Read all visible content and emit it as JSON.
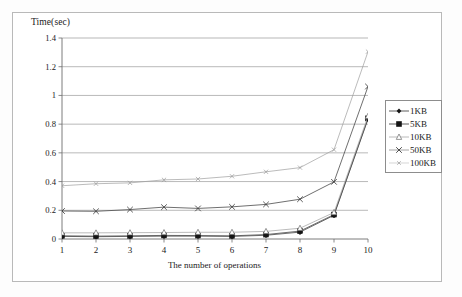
{
  "chart_data": {
    "type": "line",
    "title": "",
    "xlabel": "The number of operations",
    "ylabel": "Time(sec)",
    "x": [
      1,
      2,
      3,
      4,
      5,
      6,
      7,
      8,
      9,
      10
    ],
    "categories": [
      "1",
      "2",
      "3",
      "4",
      "5",
      "6",
      "7",
      "8",
      "9",
      "10"
    ],
    "xlim": [
      1,
      10
    ],
    "ylim": [
      0,
      1.4
    ],
    "y_ticks": [
      "0",
      "0.2",
      "0.4",
      "0.6",
      "0.8",
      "1",
      "1.2",
      "1.4"
    ],
    "y_tick_values": [
      0,
      0.2,
      0.4,
      0.6,
      0.8,
      1,
      1.2,
      1.4
    ],
    "grid": "horizontal",
    "legend_position": "right",
    "series": [
      {
        "name": "1KB",
        "marker": "filled-diamond",
        "values": [
          0.018,
          0.016,
          0.018,
          0.02,
          0.02,
          0.018,
          0.026,
          0.048,
          0.165,
          0.835
        ]
      },
      {
        "name": "5KB",
        "marker": "filled-square",
        "values": [
          0.022,
          0.02,
          0.022,
          0.025,
          0.024,
          0.022,
          0.031,
          0.055,
          0.17,
          0.84
        ]
      },
      {
        "name": "10KB",
        "marker": "open-triangle",
        "values": [
          0.043,
          0.043,
          0.044,
          0.045,
          0.047,
          0.047,
          0.053,
          0.075,
          0.185,
          0.855
        ]
      },
      {
        "name": "50KB",
        "marker": "cross-x",
        "values": [
          0.195,
          0.193,
          0.205,
          0.222,
          0.213,
          0.224,
          0.241,
          0.277,
          0.398,
          1.062
        ]
      },
      {
        "name": "100KB",
        "marker": "small-star",
        "values": [
          0.371,
          0.385,
          0.391,
          0.412,
          0.418,
          0.437,
          0.468,
          0.497,
          0.622,
          1.305
        ]
      }
    ]
  },
  "legend": {
    "items": [
      {
        "label": "1KB"
      },
      {
        "label": "5KB"
      },
      {
        "label": "10KB"
      },
      {
        "label": "50KB"
      },
      {
        "label": "100KB"
      }
    ]
  },
  "colors": {
    "line": "#4a4a4a",
    "line_light": "#9d9d9d",
    "grid": "#9a9a9a",
    "axis": "#6d6d6d",
    "frame": "#b9b9b9",
    "text": "#1a1a1a",
    "background": "#ffffff"
  }
}
